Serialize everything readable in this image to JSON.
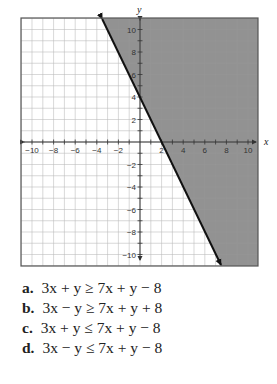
{
  "chart_data": {
    "type": "line",
    "title": "",
    "xlabel": "x",
    "ylabel": "y",
    "xlim": [
      -11,
      11
    ],
    "ylim": [
      -11,
      11
    ],
    "grid": true,
    "x_ticks": [
      -10,
      -8,
      -6,
      -4,
      -2,
      2,
      4,
      6,
      8,
      10
    ],
    "y_ticks": [
      10,
      8,
      6,
      4,
      2,
      -2,
      -4,
      -6,
      -8,
      -10
    ],
    "boundary_line": {
      "equation": "y = -2x + 4",
      "slope": -2,
      "y_intercept": 4,
      "x_intercept": 2,
      "style": "solid",
      "points": [
        [
          -3.5,
          11
        ],
        [
          0,
          4
        ],
        [
          2,
          0
        ],
        [
          7.5,
          -11
        ]
      ]
    },
    "shaded_region": "right of line (y >= -2x + 4)",
    "colors": {
      "shade": "#8c8c8c",
      "grid": "#d9d9d9",
      "line": "#111111",
      "border": "#555555"
    }
  },
  "axes": {
    "x_label": "x",
    "y_label": "y",
    "x_tick_labels": [
      "-10",
      "-8",
      "-6",
      "-4",
      "-2",
      "2",
      "4",
      "6",
      "8",
      "10"
    ],
    "y_tick_labels_pos": [
      "10",
      "8",
      "6",
      "4",
      "2"
    ],
    "y_tick_labels_neg": [
      "-2",
      "-4",
      "-6",
      "-8",
      "-10"
    ]
  },
  "answers": [
    {
      "letter": "a.",
      "expression": "3x + y ≥ 7x + y − 8"
    },
    {
      "letter": "b.",
      "expression": "3x − y ≥ 7x + y + 8"
    },
    {
      "letter": "c.",
      "expression": "3x + y ≤ 7x + y − 8"
    },
    {
      "letter": "d.",
      "expression": "3x − y ≤ 7x + y − 8"
    }
  ]
}
